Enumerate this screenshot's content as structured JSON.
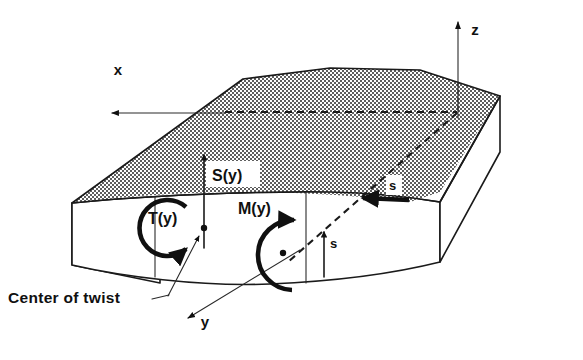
{
  "figure": {
    "background_color": "#ffffff",
    "ink_color": "#101010",
    "shade_color": "#9a9a9a"
  },
  "axes": [
    {
      "name": "x-axis",
      "label": "x",
      "direction": "left",
      "label_x": 118,
      "label_y": 75
    },
    {
      "name": "y-axis",
      "label": "y",
      "direction": "down-left",
      "label_x": 205,
      "label_y": 327
    },
    {
      "name": "z-axis",
      "label": "z",
      "direction": "up",
      "label_x": 475,
      "label_y": 35
    }
  ],
  "loads": [
    {
      "name": "shear-force",
      "label": "S(y)",
      "kind": "straight-arrow",
      "orientation": "up",
      "has_knockout_box": true,
      "label_x": 216,
      "label_y": 178
    },
    {
      "name": "torque",
      "label": "T(y)",
      "kind": "circular-arrow",
      "orientation": "counterclockwise",
      "has_knockout_box": false,
      "label_x": 148,
      "label_y": 224
    },
    {
      "name": "bending-moment",
      "label": "M(y)",
      "kind": "circular-arrow",
      "orientation": "clockwise",
      "has_knockout_box": false,
      "label_x": 238,
      "label_y": 214
    },
    {
      "name": "distributed-load-top",
      "label": "s",
      "kind": "thick-arrow",
      "orientation": "left",
      "has_knockout_box": true,
      "label_x": 393,
      "label_y": 188
    },
    {
      "name": "distributed-load-front",
      "label": "s",
      "kind": "straight-arrow",
      "orientation": "up",
      "has_knockout_box": false,
      "label_x": 334,
      "label_y": 246
    }
  ],
  "annotations": [
    {
      "name": "center-of-twist",
      "label": "Center of twist",
      "label_x": 8,
      "label_y": 303,
      "has_leader_line": true
    }
  ],
  "figure_caption": {
    "text": "",
    "visible": false
  }
}
